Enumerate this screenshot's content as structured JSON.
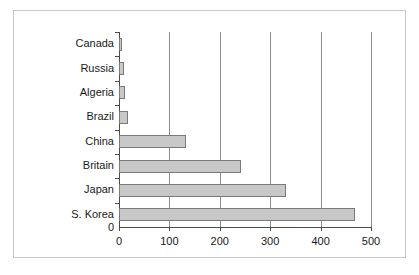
{
  "chart_data": {
    "type": "bar",
    "orientation": "horizontal",
    "title": "",
    "subtitle": "",
    "xlabel": "",
    "ylabel": "",
    "categories": [
      "Canada",
      "Russia",
      "Algeria",
      "Brazil",
      "China",
      "Britain",
      "Japan",
      "S. Korea"
    ],
    "values": [
      5,
      9,
      12,
      18,
      133,
      242,
      331,
      468
    ],
    "xlim": [
      0,
      500
    ],
    "x_ticks": [
      0,
      100,
      200,
      300,
      400,
      500
    ],
    "x_tick_labels": [
      "0",
      "100",
      "200",
      "300",
      "400",
      "500"
    ],
    "y_origin_label": "0",
    "grid": "vertical",
    "legend": "none",
    "bar_fill_color": "#c8c8c8",
    "bar_border_color": "#7a7a7a",
    "grid_color": "#8c8c8c",
    "axis_color": "#4d4d4d",
    "frame_color": "#c9c9c9",
    "background_color": "#ffffff"
  }
}
